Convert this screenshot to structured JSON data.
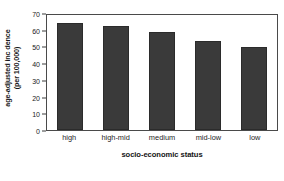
{
  "chart_data": {
    "type": "bar",
    "title": "",
    "subtitle": "",
    "categories": [
      "high",
      "high-mid",
      "medium",
      "mid-low",
      "low"
    ],
    "values": [
      64,
      62.5,
      58.5,
      53.5,
      49.5
    ],
    "series": [
      {
        "name": "age-adjusted incidence",
        "values": [
          64,
          62.5,
          58.5,
          53.5,
          49.5
        ]
      }
    ],
    "xlabel": "socio-economic status",
    "ylabel_line1": "age-adjusted inc dence",
    "ylabel_line2": "(per 100,000)",
    "ylim": [
      0,
      70
    ],
    "yticks": [
      0,
      10,
      20,
      30,
      40,
      50,
      60,
      70
    ],
    "ytick_labels": [
      "0",
      "10",
      "20",
      "30",
      "40",
      "50",
      "60",
      "70"
    ],
    "grid": false,
    "legend": "none",
    "bar_color": "#3a3a3a",
    "axis_color": "#4a4a4a",
    "background_color": "#ffffff"
  }
}
